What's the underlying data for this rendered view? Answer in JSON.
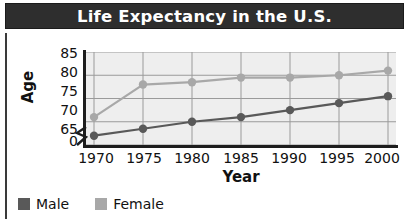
{
  "chart_data": {
    "type": "line",
    "title": "Life Expectancy in the U.S.",
    "xlabel": "Year",
    "ylabel": "Age",
    "categories": [
      "1970",
      "1975",
      "1980",
      "1985",
      "1990",
      "1995",
      "2000"
    ],
    "x": [
      1970,
      1975,
      1980,
      1985,
      1990,
      1995,
      2000
    ],
    "series": [
      {
        "name": "Male",
        "color": "#595959",
        "values": [
          67,
          68.5,
          70,
          71,
          72.5,
          74,
          75.5
        ]
      },
      {
        "name": "Female",
        "color": "#a8a8a8",
        "values": [
          71,
          78,
          78.5,
          79.5,
          79.5,
          80,
          81
        ]
      }
    ],
    "ylim": [
      65,
      85
    ],
    "yticks": [
      "85",
      "80",
      "75",
      "70",
      "65",
      "0"
    ],
    "ytick_values": [
      85,
      80,
      75,
      70,
      65,
      0
    ],
    "y_axis_break": true,
    "grid": true,
    "grid_color": "#9a9a9a",
    "plot_background": "#eeeeee",
    "legend_position": "bottom-left",
    "title_background": "#2e2e2e",
    "title_color": "#ffffff"
  },
  "legend": {
    "items": [
      {
        "label": "Male",
        "color": "#595959"
      },
      {
        "label": "Female",
        "color": "#a8a8a8"
      }
    ]
  },
  "axes": {
    "y_tick_0": "85",
    "y_tick_1": "80",
    "y_tick_2": "75",
    "y_tick_3": "70",
    "y_tick_4": "65",
    "y_tick_5": "0",
    "x_tick_0": "1970",
    "x_tick_1": "1975",
    "x_tick_2": "1980",
    "x_tick_3": "1985",
    "x_tick_4": "1990",
    "x_tick_5": "1995",
    "x_tick_6": "2000"
  }
}
